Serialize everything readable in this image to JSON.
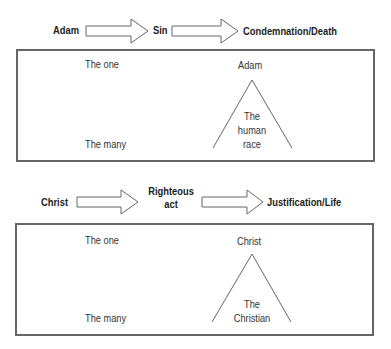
{
  "panels": [
    {
      "flow": {
        "source": "Adam",
        "middle": "Sin",
        "result": "Condemnation/Death"
      },
      "box": {
        "one_label": "The one",
        "many_label": "The many",
        "apex_label": "Adam",
        "triangle_text": [
          "The",
          "human",
          "race"
        ]
      }
    },
    {
      "flow": {
        "source": "Christ",
        "middle": "Righteous act",
        "middle_lines": [
          "Righteous",
          "act"
        ],
        "result": "Justification/Life"
      },
      "box": {
        "one_label": "The one",
        "many_label": "The many",
        "apex_label": "Christ",
        "triangle_text": [
          "The",
          "Christian"
        ]
      }
    }
  ],
  "colors": {
    "stroke": "#666666",
    "text": "#2a2a2a",
    "background": "#ffffff"
  }
}
